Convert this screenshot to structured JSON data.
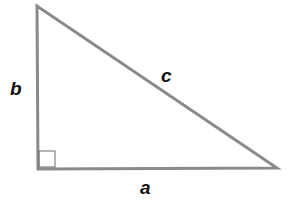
{
  "diagram": {
    "labels": {
      "a": "a",
      "b": "b",
      "c": "c"
    },
    "colors": {
      "stroke": "#8a8a8a",
      "right_angle_marker": "#6a6a6a",
      "label": "#111111",
      "background": "#ffffff"
    },
    "vertices": {
      "top": [
        37,
        6
      ],
      "right_angle": [
        38,
        169
      ],
      "right": [
        277,
        168
      ]
    }
  }
}
